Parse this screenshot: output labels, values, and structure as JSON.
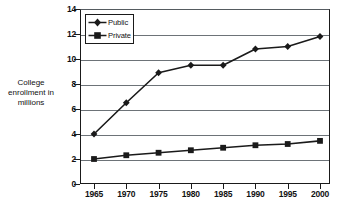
{
  "chart_data": {
    "type": "line",
    "title": "",
    "xlabel": "",
    "ylabel": "College enrollment in millions",
    "ylabel_lines": [
      "College",
      "enrollment in",
      "millions"
    ],
    "categories": [
      "1965",
      "1970",
      "1975",
      "1980",
      "1985",
      "1990",
      "1995",
      "2000"
    ],
    "ylim": [
      0,
      14
    ],
    "ytick_step": 2,
    "yticks": [
      "14",
      "12",
      "10",
      "8",
      "6",
      "4",
      "2",
      "0"
    ],
    "ytick_values": [
      14,
      12,
      10,
      8,
      6,
      4,
      2,
      0
    ],
    "grid": true,
    "grid_axis": "y",
    "legend_position": "top-left-inside",
    "series": [
      {
        "name": "Public",
        "marker": "diamond",
        "color": "#1a1a1a",
        "values": [
          4.0,
          6.5,
          8.9,
          9.5,
          9.5,
          10.8,
          11.0,
          11.8
        ]
      },
      {
        "name": "Private",
        "marker": "square",
        "color": "#1a1a1a",
        "values": [
          2.0,
          2.3,
          2.5,
          2.7,
          2.9,
          3.1,
          3.2,
          3.45
        ]
      }
    ]
  },
  "colors": {
    "background": "#ffffff",
    "axis": "#1a1a1a",
    "gridline": "#6d7378",
    "series": "#1a1a1a",
    "text": "#111111"
  }
}
